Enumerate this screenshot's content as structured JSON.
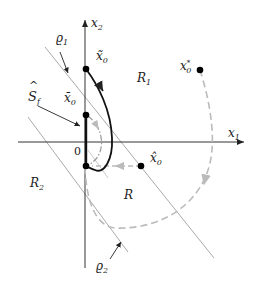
{
  "diagram": {
    "axes": {
      "x_label": "x",
      "x_sub": "1",
      "y_label": "x",
      "y_sub": "2",
      "origin_label": "0"
    },
    "regions": [
      {
        "name": "R",
        "sub": "1"
      },
      {
        "name": "R",
        "sub": "2"
      },
      {
        "name": "R",
        "sub": ""
      }
    ],
    "lines": [
      {
        "name": "ϱ",
        "sub": "1"
      },
      {
        "name": "ϱ",
        "sub": "2"
      }
    ],
    "set_label": {
      "name": "S",
      "sub": "f",
      "accent": "^"
    },
    "points": [
      {
        "label": "x",
        "sub": "0",
        "sup": "*"
      },
      {
        "label": "x̃",
        "sub": "0"
      },
      {
        "label": "x̄",
        "sub": "0"
      },
      {
        "label": "x̂",
        "sub": "0"
      }
    ],
    "colors": {
      "axis": "#333333",
      "boundary_line": "#aaaaaa",
      "trajectory": "#111111",
      "dashed_trajectory": "#bbbbbb",
      "dashdot_trajectory": "#999999",
      "point": "#000000"
    }
  }
}
